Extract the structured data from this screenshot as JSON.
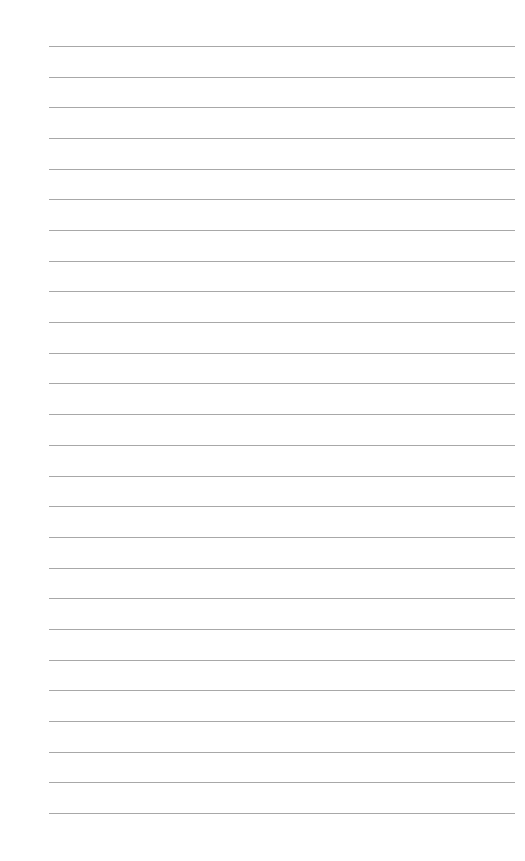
{
  "page": {
    "type": "lined-paper",
    "background": "#ffffff",
    "rule_color": "#a8a8a8",
    "rule_count": 26,
    "rule_left": 49,
    "rule_right": 515,
    "first_rule_y": 46,
    "rule_spacing": 30.68
  }
}
